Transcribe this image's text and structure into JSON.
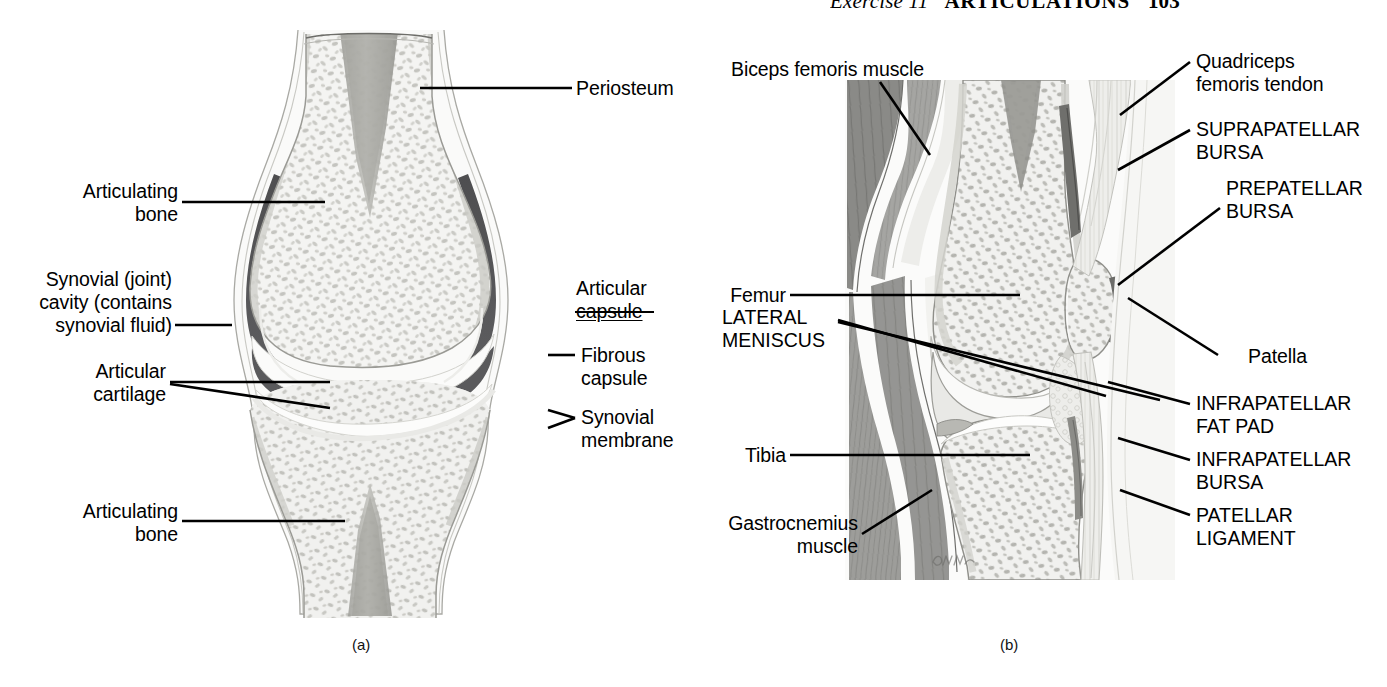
{
  "running_head": {
    "exercise": "Exercise 11",
    "title": "ARTICULATIONS",
    "page": "103"
  },
  "figure": {
    "panel_a": {
      "caption": "(a)",
      "labels": {
        "periosteum": "Periosteum",
        "articulating_bone_top": "Articulating\nbone",
        "synovial_cavity": "Synovial (joint)\ncavity (contains\nsynovial fluid)",
        "articular_cartilage": "Articular\ncartilage",
        "articulating_bone_bottom": "Articulating\nbone",
        "articular_capsule_line1": "Articular",
        "articular_capsule_line2": "capsule",
        "fibrous_capsule": "Fibrous\ncapsule",
        "synovial_membrane": "Synovial\nmembrane"
      }
    },
    "panel_b": {
      "caption": "(b)",
      "artist_signature": "D.M.M.",
      "labels": {
        "biceps_femoris": "Biceps femoris muscle",
        "femur": "Femur",
        "lateral_meniscus": "LATERAL\nMENISCUS",
        "tibia": "Tibia",
        "gastrocnemius": "Gastrocnemius\nmuscle",
        "quadriceps_tendon": "Quadriceps\nfemoris tendon",
        "suprapatellar_bursa": "SUPRAPATELLAR\nBURSA",
        "prepatellar_bursa": "PREPATELLAR\nBURSA",
        "patella": "Patella",
        "infrapatellar_fat_pad": "INFRAPATELLAR\nFAT PAD",
        "infrapatellar_bursa": "INFRAPATELLAR\nBURSA",
        "patellar_ligament": "PATELLAR\nLIGAMENT"
      }
    }
  },
  "colors": {
    "ink": "#000000",
    "page_background": "#ffffff",
    "bone_fill": "#f2f2f0",
    "bone_outline": "#8d8d8a",
    "trabecula": "#bdbdb8",
    "marrow": "#a9a9a4",
    "synovial_cavity": "#58585a",
    "cartilage": "#fbfbfb",
    "capsule_outer": "#e6e6e3",
    "muscle": "#9b9b98",
    "muscle_dark": "#7e7e7b",
    "tendon": "#ededea",
    "fat_pad": "#e3e3e0"
  }
}
